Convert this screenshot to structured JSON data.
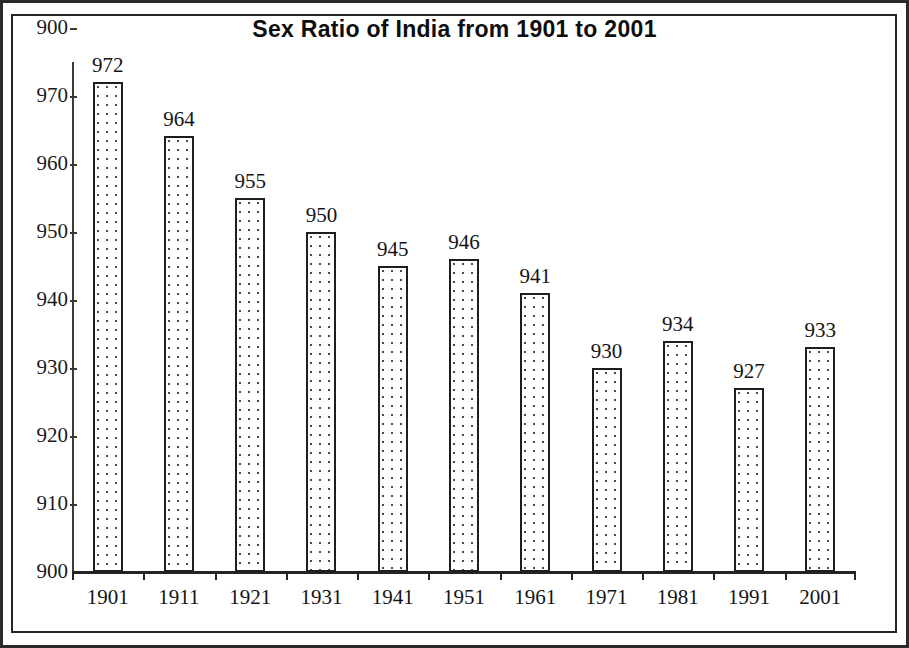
{
  "chart_data": {
    "type": "bar",
    "title": "Sex Ratio of India from 1901 to 2001",
    "xlabel": "",
    "ylabel": "",
    "categories": [
      "1901",
      "1911",
      "1921",
      "1931",
      "1941",
      "1951",
      "1961",
      "1971",
      "1981",
      "1991",
      "2001"
    ],
    "values": [
      972,
      964,
      955,
      950,
      945,
      946,
      941,
      930,
      934,
      927,
      933
    ],
    "value_labels": [
      "972",
      "964",
      "955",
      "950",
      "945",
      "946",
      "941",
      "930",
      "934",
      "927",
      "933"
    ],
    "ylim": [
      900,
      980
    ],
    "y_tick_labels": [
      "900",
      "970",
      "960",
      "950",
      "940",
      "930",
      "920",
      "910",
      "900"
    ],
    "y_tick_values": [
      980,
      970,
      960,
      950,
      940,
      930,
      920,
      910,
      900
    ],
    "grid": false,
    "legend": false,
    "series_name": "Sex Ratio",
    "bar_fill": "dotted-stipple",
    "bar_outline_color": "#1e1e1e",
    "axis_color": "#242424",
    "text_color": "#141414",
    "background_color": "#ffffff"
  }
}
